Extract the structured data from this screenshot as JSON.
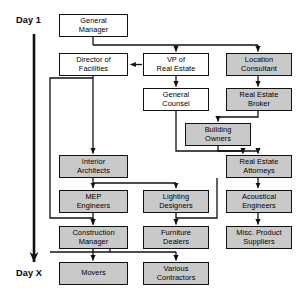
{
  "diagram": {
    "timeline": {
      "start_label": "Day 1",
      "end_label": "Day X",
      "axis_name": "vertical-time-arrow"
    },
    "legend": {
      "white_fill": "#ffffff",
      "shaded_fill": "#c9c9c9",
      "stroke": "#111111"
    },
    "nodes": [
      {
        "id": "general-manager",
        "label": "General\nManager",
        "shaded": false,
        "x": 59,
        "y": 14,
        "w": 69,
        "h": 23
      },
      {
        "id": "director-of-facilities",
        "label": "Director of\nFacilities",
        "shaded": false,
        "x": 59,
        "y": 53,
        "w": 69,
        "h": 23
      },
      {
        "id": "vp-of-real-estate",
        "label": "VP of\nReal Estate",
        "shaded": false,
        "x": 143,
        "y": 53,
        "w": 66,
        "h": 23
      },
      {
        "id": "location-consultant",
        "label": "Location\nConsultant",
        "shaded": true,
        "x": 226,
        "y": 53,
        "w": 66,
        "h": 23
      },
      {
        "id": "general-counsel",
        "label": "General\nCounsel",
        "shaded": false,
        "x": 143,
        "y": 88,
        "w": 66,
        "h": 23
      },
      {
        "id": "real-estate-broker",
        "label": "Real Estate\nBroker",
        "shaded": true,
        "x": 226,
        "y": 88,
        "w": 66,
        "h": 23
      },
      {
        "id": "building-owners",
        "label": "Building\nOwners",
        "shaded": true,
        "x": 185,
        "y": 123,
        "w": 66,
        "h": 23
      },
      {
        "id": "interior-architects",
        "label": "Interior\nArchitects",
        "shaded": true,
        "x": 59,
        "y": 155,
        "w": 69,
        "h": 23
      },
      {
        "id": "real-estate-attorneys",
        "label": "Real Estate\nAttorneys",
        "shaded": true,
        "x": 226,
        "y": 155,
        "w": 66,
        "h": 23
      },
      {
        "id": "mep-engineers",
        "label": "MEP\nEngineers",
        "shaded": true,
        "x": 59,
        "y": 190,
        "w": 69,
        "h": 23
      },
      {
        "id": "lighting-designers",
        "label": "Lighting\nDesigners",
        "shaded": true,
        "x": 143,
        "y": 190,
        "w": 66,
        "h": 23
      },
      {
        "id": "acoustical-engineers",
        "label": "Acoustical\nEngineers",
        "shaded": true,
        "x": 226,
        "y": 190,
        "w": 66,
        "h": 23
      },
      {
        "id": "construction-manager",
        "label": "Construction\nManager",
        "shaded": true,
        "x": 59,
        "y": 226,
        "w": 69,
        "h": 23
      },
      {
        "id": "furniture-dealers",
        "label": "Furniture\nDealers",
        "shaded": true,
        "x": 143,
        "y": 226,
        "w": 66,
        "h": 23
      },
      {
        "id": "misc-product-suppliers",
        "label": "Misc. Product\nSuppliers",
        "shaded": true,
        "x": 226,
        "y": 226,
        "w": 66,
        "h": 23
      },
      {
        "id": "movers",
        "label": "Movers",
        "shaded": true,
        "x": 59,
        "y": 262,
        "w": 69,
        "h": 23
      },
      {
        "id": "various-contractors",
        "label": "Various\nContractors",
        "shaded": true,
        "x": 143,
        "y": 262,
        "w": 66,
        "h": 23
      }
    ],
    "edges": [
      {
        "from": "general-manager",
        "to": "vp-of-real-estate"
      },
      {
        "from": "general-manager",
        "to": "location-consultant"
      },
      {
        "from": "vp-of-real-estate",
        "to": "director-of-facilities"
      },
      {
        "from": "vp-of-real-estate",
        "to": "general-counsel"
      },
      {
        "from": "location-consultant",
        "to": "real-estate-broker"
      },
      {
        "from": "real-estate-broker",
        "to": "building-owners"
      },
      {
        "from": "building-owners",
        "to": "real-estate-attorneys"
      },
      {
        "from": "general-counsel",
        "to": "real-estate-attorneys"
      },
      {
        "from": "director-of-facilities",
        "to": "interior-architects"
      },
      {
        "from": "director-of-facilities",
        "to": "construction-manager"
      },
      {
        "from": "interior-architects",
        "to": "mep-engineers"
      },
      {
        "from": "interior-architects",
        "to": "lighting-designers"
      },
      {
        "from": "real-estate-attorneys",
        "to": "acoustical-engineers"
      },
      {
        "from": "mep-engineers",
        "to": "construction-manager"
      },
      {
        "from": "lighting-designers",
        "to": "furniture-dealers"
      },
      {
        "from": "acoustical-engineers",
        "to": "misc-product-suppliers"
      },
      {
        "from": "construction-manager",
        "to": "movers"
      },
      {
        "from": "construction-manager",
        "to": "various-contractors"
      }
    ]
  }
}
